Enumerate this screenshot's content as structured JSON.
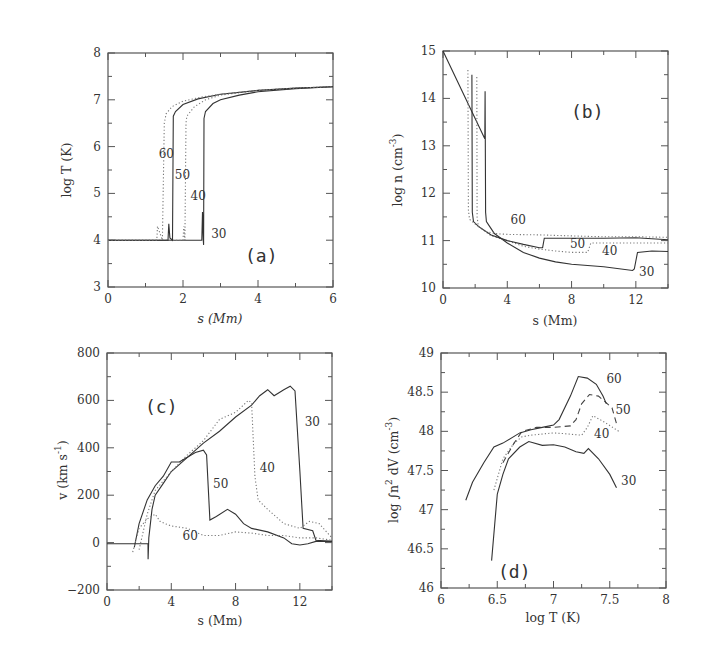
{
  "chart_data": [
    {
      "id": "a",
      "type": "line",
      "panel_label": "(a)",
      "title": "",
      "xlabel": "s (Mm)",
      "ylabel": "log T (K)",
      "xlim": [
        0,
        6
      ],
      "ylim": [
        3,
        8
      ],
      "xticks": [
        0,
        2,
        4,
        6
      ],
      "yticks": [
        3,
        4,
        5,
        6,
        7,
        8
      ],
      "x_minor_step": 1,
      "y_minor_step": 0.5,
      "series": [
        {
          "name": "30",
          "style": "solid",
          "x": [
            0,
            2.5,
            2.52,
            2.54,
            2.55,
            2.56,
            2.6,
            2.8,
            3.0,
            3.5,
            4.0,
            5.0,
            6.0
          ],
          "y": [
            4.0,
            4.0,
            4.6,
            4.0,
            3.9,
            6.6,
            6.75,
            6.92,
            7.0,
            7.1,
            7.17,
            7.24,
            7.28
          ]
        },
        {
          "name": "40",
          "style": "dotted",
          "x": [
            0,
            2.0,
            2.02,
            2.05,
            2.08,
            2.1,
            2.3,
            2.6,
            3.0,
            4.0,
            5.0,
            6.0
          ],
          "y": [
            4.0,
            4.0,
            4.3,
            4.0,
            6.5,
            6.65,
            6.85,
            7.0,
            7.1,
            7.2,
            7.25,
            7.28
          ]
        },
        {
          "name": "50",
          "style": "solid",
          "x": [
            0,
            1.6,
            1.62,
            1.65,
            1.72,
            1.74,
            1.8,
            2.0,
            2.4,
            3.0,
            4.0,
            5.0,
            6.0
          ],
          "y": [
            4.0,
            4.0,
            4.35,
            4.05,
            4.0,
            6.65,
            6.75,
            6.9,
            7.02,
            7.12,
            7.2,
            7.25,
            7.28
          ]
        },
        {
          "name": "60",
          "style": "dotted",
          "x": [
            0,
            1.3,
            1.32,
            1.45,
            1.5,
            1.55,
            1.7,
            2.0,
            2.5,
            3.0,
            4.0,
            5.0,
            6.0
          ],
          "y": [
            4.0,
            4.0,
            4.3,
            4.0,
            6.5,
            6.7,
            6.85,
            6.97,
            7.06,
            7.12,
            7.2,
            7.25,
            7.28
          ]
        }
      ],
      "annotations": [
        {
          "text": "60",
          "x": 1.35,
          "y": 5.75
        },
        {
          "text": "50",
          "x": 1.78,
          "y": 5.3
        },
        {
          "text": "40",
          "x": 2.2,
          "y": 4.85
        },
        {
          "text": "30",
          "x": 2.75,
          "y": 4.05
        }
      ]
    },
    {
      "id": "b",
      "type": "line",
      "panel_label": "(b)",
      "title": "",
      "xlabel": "s (Mm)",
      "ylabel": "log n (cm^-3)",
      "ylabel_main": "log n (cm",
      "ylabel_sup": "-3",
      "xlim": [
        0,
        14
      ],
      "ylim": [
        10,
        15
      ],
      "xticks": [
        0,
        4,
        8,
        12
      ],
      "yticks": [
        10,
        11,
        12,
        13,
        14,
        15
      ],
      "x_minor_step": 2,
      "y_minor_step": 0.5,
      "series": [
        {
          "name": "30",
          "style": "solid",
          "x": [
            0,
            2.6,
            2.62,
            2.65,
            2.7,
            2.9,
            3.2,
            4.0,
            5.0,
            6.0,
            7.0,
            8.0,
            10.0,
            11.8,
            11.9,
            12.1,
            13.0,
            14.0
          ],
          "y": [
            15.0,
            13.15,
            14.15,
            11.6,
            11.4,
            11.3,
            11.15,
            10.95,
            10.75,
            10.63,
            10.55,
            10.5,
            10.45,
            10.37,
            10.4,
            10.75,
            10.78,
            10.77
          ]
        },
        {
          "name": "40",
          "style": "dotted",
          "x": [
            2.1,
            2.12,
            2.2,
            2.4,
            3.0,
            4.0,
            5.0,
            6.0,
            7.0,
            8.0,
            9.0,
            9.2,
            9.3,
            10.0,
            12.0,
            14.0
          ],
          "y": [
            14.45,
            11.5,
            11.3,
            11.25,
            11.1,
            11.0,
            10.88,
            10.82,
            10.78,
            10.75,
            10.75,
            10.95,
            10.95,
            10.95,
            10.95,
            10.95
          ]
        },
        {
          "name": "50",
          "style": "solid",
          "x": [
            1.8,
            1.82,
            1.9,
            2.2,
            3.0,
            4.0,
            5.0,
            6.0,
            6.2,
            6.3,
            8.0,
            10.0,
            12.0,
            14.0
          ],
          "y": [
            14.5,
            11.6,
            11.4,
            11.3,
            11.12,
            11.0,
            10.92,
            10.85,
            10.85,
            11.05,
            11.05,
            11.05,
            11.06,
            11.02
          ]
        },
        {
          "name": "60",
          "style": "dotted",
          "x": [
            1.55,
            1.58,
            1.65,
            2.0,
            2.6,
            3.2,
            4.0,
            6.0,
            8.0,
            10.0,
            12.0,
            14.0
          ],
          "y": [
            14.6,
            11.65,
            11.45,
            11.35,
            11.2,
            11.15,
            11.13,
            11.12,
            11.1,
            11.08,
            11.08,
            11.07
          ]
        }
      ],
      "annotations": [
        {
          "text": "60",
          "x": 4.2,
          "y": 11.35
        },
        {
          "text": "50",
          "x": 7.9,
          "y": 10.85
        },
        {
          "text": "40",
          "x": 9.9,
          "y": 10.7
        },
        {
          "text": "30",
          "x": 12.2,
          "y": 10.25
        }
      ]
    },
    {
      "id": "c",
      "type": "line",
      "panel_label": "(c)",
      "title": "",
      "xlabel": "s (Mm)",
      "ylabel": "v (km s^-1)",
      "ylabel_main": "v (km s",
      "ylabel_sup": "-1",
      "xlim": [
        0,
        14
      ],
      "ylim": [
        -200,
        800
      ],
      "xticks": [
        0,
        4,
        8,
        12
      ],
      "yticks": [
        -200,
        0,
        200,
        400,
        600,
        800
      ],
      "x_minor_step": 2,
      "y_minor_step": 100,
      "series": [
        {
          "name": "30",
          "style": "solid",
          "x": [
            0,
            2.55,
            2.56,
            2.6,
            2.8,
            3.0,
            3.5,
            4.0,
            5.0,
            6.0,
            7.0,
            8.0,
            9.0,
            9.5,
            10.0,
            10.4,
            11.0,
            11.4,
            11.7,
            12.0,
            12.2,
            12.8,
            13.0,
            14.0
          ],
          "y": [
            -5,
            -5,
            -70,
            20,
            140,
            200,
            250,
            300,
            360,
            420,
            470,
            530,
            580,
            620,
            645,
            620,
            645,
            660,
            640,
            300,
            60,
            50,
            10,
            5
          ]
        },
        {
          "name": "40",
          "style": "dotted",
          "x": [
            2.0,
            2.5,
            3.0,
            4.0,
            5.0,
            6.0,
            7.0,
            8.0,
            8.8,
            9.0,
            9.2,
            9.4,
            10.0,
            11.0,
            12.0,
            12.6,
            13.2,
            14.0
          ],
          "y": [
            -30,
            120,
            220,
            300,
            370,
            430,
            520,
            550,
            600,
            590,
            280,
            180,
            140,
            80,
            60,
            90,
            80,
            20
          ]
        },
        {
          "name": "50",
          "style": "solid",
          "x": [
            1.7,
            2.0,
            2.5,
            3.0,
            3.5,
            4.0,
            4.5,
            5.0,
            5.5,
            6.0,
            6.2,
            6.4,
            6.8,
            7.5,
            8.0,
            8.5,
            9.0,
            10.0,
            11.0,
            11.5,
            12.0,
            12.5,
            13.0,
            14.0
          ],
          "y": [
            -20,
            80,
            180,
            240,
            280,
            340,
            340,
            360,
            380,
            390,
            370,
            95,
            110,
            140,
            120,
            80,
            60,
            45,
            20,
            -5,
            -10,
            -5,
            5,
            5
          ]
        },
        {
          "name": "60",
          "style": "dotted",
          "x": [
            1.6,
            2.0,
            2.5,
            3.0,
            3.3,
            3.6,
            4.0,
            5.0,
            6.0,
            7.0,
            8.0,
            9.0,
            10.0,
            11.0,
            12.0,
            13.0,
            14.0
          ],
          "y": [
            -40,
            60,
            100,
            120,
            90,
            80,
            70,
            60,
            30,
            30,
            45,
            40,
            30,
            30,
            20,
            20,
            10
          ]
        }
      ],
      "annotations": [
        {
          "text": "30",
          "x": 12.3,
          "y": 490
        },
        {
          "text": "40",
          "x": 9.5,
          "y": 300
        },
        {
          "text": "50",
          "x": 6.6,
          "y": 230
        },
        {
          "text": "60",
          "x": 4.7,
          "y": 10
        }
      ]
    },
    {
      "id": "d",
      "type": "line",
      "panel_label": "(d)",
      "title": "",
      "xlabel": "log T (K)",
      "ylabel": "log ∫n^2 dV (cm^-3)",
      "ylabel_main": "log ∫n",
      "ylabel_sup1": "2",
      "ylabel_mid": " dV (cm",
      "ylabel_sup2": "-3",
      "xlim": [
        6,
        8
      ],
      "ylim": [
        46,
        49
      ],
      "xticks": [
        6,
        6.5,
        7,
        7.5,
        8
      ],
      "xtick_labels": [
        "6",
        "6.5",
        "7",
        "7.5",
        "8"
      ],
      "yticks": [
        46,
        46.5,
        47,
        47.5,
        48,
        48.5,
        49
      ],
      "ytick_labels": [
        "46",
        "46.5",
        "47",
        "47.5",
        "48",
        "48.5",
        "49"
      ],
      "x_minor_step": 0.25,
      "y_minor_step": 0.25,
      "series": [
        {
          "name": "30",
          "style": "solid",
          "x": [
            6.45,
            6.5,
            6.55,
            6.6,
            6.7,
            6.78,
            6.9,
            7.0,
            7.1,
            7.2,
            7.27,
            7.31,
            7.4,
            7.5,
            7.56
          ],
          "y": [
            46.35,
            47.2,
            47.45,
            47.65,
            47.8,
            47.87,
            47.82,
            47.83,
            47.8,
            47.74,
            47.72,
            47.78,
            47.65,
            47.45,
            47.28
          ]
        },
        {
          "name": "40",
          "style": "dotted",
          "x": [
            6.47,
            6.55,
            6.65,
            6.72,
            6.8,
            7.0,
            7.1,
            7.25,
            7.3,
            7.35,
            7.45,
            7.58
          ],
          "y": [
            47.25,
            47.65,
            47.85,
            47.93,
            47.95,
            47.98,
            47.97,
            47.95,
            48.05,
            48.2,
            48.12,
            48.0
          ]
        },
        {
          "name": "50",
          "style": "dashed",
          "x": [
            6.55,
            6.65,
            6.72,
            6.85,
            7.0,
            7.15,
            7.2,
            7.25,
            7.32,
            7.4,
            7.52,
            7.56
          ],
          "y": [
            47.6,
            47.85,
            48.0,
            48.05,
            48.05,
            48.07,
            48.15,
            48.35,
            48.47,
            48.45,
            48.3,
            48.1
          ]
        },
        {
          "name": "60",
          "style": "solid",
          "x": [
            6.22,
            6.28,
            6.38,
            6.47,
            6.55,
            6.7,
            6.8,
            6.9,
            7.0,
            7.05,
            7.15,
            7.22,
            7.3,
            7.38,
            7.44,
            7.47
          ],
          "y": [
            47.12,
            47.35,
            47.6,
            47.8,
            47.85,
            47.98,
            48.02,
            48.05,
            48.08,
            48.15,
            48.45,
            48.7,
            48.68,
            48.6,
            48.45,
            48.35
          ]
        }
      ],
      "annotations": [
        {
          "text": "60",
          "x": 7.47,
          "y": 48.62
        },
        {
          "text": "50",
          "x": 7.55,
          "y": 48.22
        },
        {
          "text": "40",
          "x": 7.36,
          "y": 47.92
        },
        {
          "text": "30",
          "x": 7.6,
          "y": 47.32
        }
      ]
    }
  ]
}
